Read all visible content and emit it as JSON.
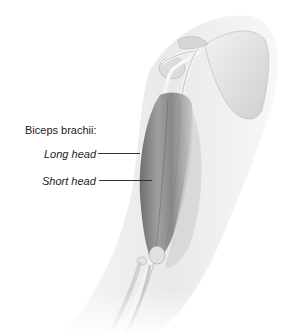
{
  "figure": {
    "labels": {
      "title": "Biceps brachii:",
      "long_head": "Long head",
      "short_head": "Short head"
    },
    "colors": {
      "skin_silhouette": "#ececec",
      "bone": "#e2e2e2",
      "muscle_dark": "#8a8a8a",
      "muscle_mid": "#b5b5b5",
      "tendon": "#f4f4f4",
      "label_text": "#222222",
      "leader_line": "#333333"
    }
  }
}
